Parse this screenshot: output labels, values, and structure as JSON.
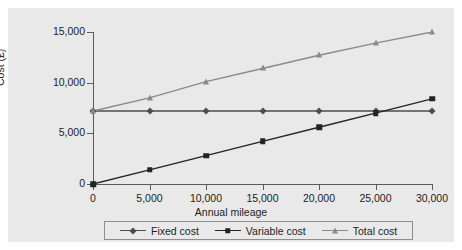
{
  "chart_data": {
    "type": "line",
    "title": "",
    "xlabel": "Annual mileage",
    "ylabel": "Cost (£)",
    "xlim": [
      0,
      30000
    ],
    "ylim": [
      0,
      15000
    ],
    "grid": false,
    "legend_position": "bottom",
    "x": [
      0,
      5000,
      10000,
      15000,
      20000,
      25000,
      30000
    ],
    "xticklabels": [
      "0",
      "5,000",
      "10,000",
      "15,000",
      "20,000",
      "25,000",
      "30,000"
    ],
    "yticks": [
      0,
      5000,
      10000,
      15000
    ],
    "yticklabels": [
      "0",
      "5,000",
      "10,000",
      "15,000"
    ],
    "series": [
      {
        "name": "Fixed cost",
        "marker": "diamond",
        "color": "#4d4d4d",
        "values": [
          7200,
          7200,
          7200,
          7200,
          7200,
          7200,
          7200
        ]
      },
      {
        "name": "Variable cost",
        "marker": "square",
        "color": "#232323",
        "values": [
          0,
          1400,
          2800,
          4200,
          5600,
          7000,
          8400
        ]
      },
      {
        "name": "Total cost",
        "marker": "triangle",
        "color": "#8a8a8a",
        "values": [
          7200,
          8500,
          10100,
          11400,
          12700,
          13900,
          15000
        ]
      }
    ]
  },
  "legend": {
    "items": [
      {
        "label": "Fixed cost"
      },
      {
        "label": "Variable cost"
      },
      {
        "label": "Total cost"
      }
    ]
  },
  "colors": {
    "figure_background": "#e9e9e9",
    "page_background": "#ffffff",
    "axis": "#5a5a5a",
    "text": "#1d1d1d",
    "legend_border": "#8d8d8d"
  }
}
